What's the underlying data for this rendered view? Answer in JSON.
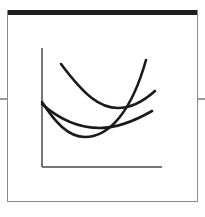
{
  "diagram": {
    "type": "curve-sketch",
    "axes": {
      "x_label": "",
      "y_label": ""
    },
    "curves": [
      {
        "name": "upper-curve",
        "color": "#1a1a1a"
      },
      {
        "name": "steep-curve",
        "color": "#1a1a1a"
      },
      {
        "name": "shallow-curve",
        "color": "#1a1a1a"
      }
    ],
    "colors": {
      "frame": "#8a8a8a",
      "header_bar": "#1e1e1e",
      "axes": "#4a4a4a",
      "curves": "#1a1a1a"
    }
  }
}
